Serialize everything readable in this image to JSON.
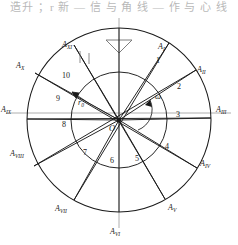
{
  "page": {
    "cut_text": "造升 ；r 新 — 信 与 角 线 — 作 与 心 线",
    "bg": "#ffffff",
    "ink": "#1a1a1a",
    "axis_color": "#8c8c8c"
  },
  "figure": {
    "type": "cam-displacement-diagram",
    "center_label": "O",
    "omega_label": "ω",
    "radius_label": "r",
    "radius_sub": "0",
    "outer_radius": 92,
    "inner_radius": 48,
    "center_x": 119,
    "center_y": 120
  },
  "outer_points": [
    {
      "name": "A",
      "sub": "I",
      "angle": 75,
      "x": 160,
      "y": 49
    },
    {
      "name": "A",
      "sub": "II",
      "angle": 45,
      "x": 199,
      "y": 70
    },
    {
      "name": "A",
      "sub": "III",
      "angle": 0,
      "x": 222,
      "y": 112
    },
    {
      "name": "A",
      "sub": "IV",
      "angle": -40,
      "x": 203,
      "y": 165
    },
    {
      "name": "A",
      "sub": "V",
      "angle": -70,
      "x": 171,
      "y": 209
    },
    {
      "name": "A",
      "sub": "VI",
      "angle": -90,
      "x": 114,
      "y": 231
    },
    {
      "name": "A",
      "sub": "VII",
      "angle": -115,
      "x": 59,
      "y": 209
    },
    {
      "name": "A",
      "sub": "VIII",
      "angle": -150,
      "x": 12,
      "y": 156
    },
    {
      "name": "A",
      "sub": "IX",
      "angle": 180,
      "x": 2,
      "y": 112
    },
    {
      "name": "A",
      "sub": "X",
      "angle": 150,
      "x": 18,
      "y": 67
    },
    {
      "name": "A",
      "sub": "XI",
      "angle": 108,
      "x": 65,
      "y": 45
    }
  ],
  "inner_numbers": [
    {
      "value": "1",
      "x": 157,
      "y": 60
    },
    {
      "value": "2",
      "x": 178,
      "y": 86
    },
    {
      "value": "3",
      "x": 177,
      "y": 114
    },
    {
      "value": "4",
      "x": 166,
      "y": 146
    },
    {
      "value": "5",
      "x": 136,
      "y": 158
    },
    {
      "value": "6",
      "x": 113,
      "y": 160
    },
    {
      "value": "7",
      "x": 84,
      "y": 152
    },
    {
      "value": "8",
      "x": 63,
      "y": 124
    },
    {
      "value": "9",
      "x": 57,
      "y": 98
    },
    {
      "value": "10",
      "x": 65,
      "y": 76
    }
  ],
  "annotations": {
    "omega": {
      "x": 156,
      "y": 96,
      "text": "ω"
    },
    "origin": {
      "x": 110,
      "y": 126,
      "text": "O"
    },
    "r0": {
      "x": 78,
      "y": 100,
      "text": "r",
      "sub": "0"
    }
  },
  "follower": {
    "name": "follower-arrow",
    "top_y": 18,
    "tip_y": 52,
    "x": 119
  }
}
